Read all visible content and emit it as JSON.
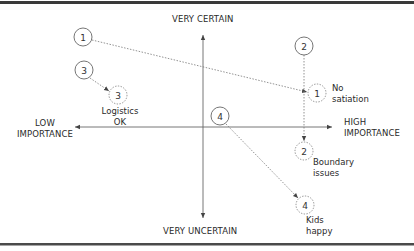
{
  "diagram": {
    "type": "quadrant-matrix",
    "axes": {
      "top_label": "VERY CERTAIN",
      "bottom_label": "VERY UNCERTAIN",
      "left_label_line1": "LOW",
      "left_label_line2": "IMPORTANCE",
      "right_label_line1": "HIGH",
      "right_label_line2": "IMPORTANCE"
    },
    "nodes": [
      {
        "id": "start-1",
        "number": "1",
        "style": "solid",
        "x": 83,
        "y": 37
      },
      {
        "id": "start-3",
        "number": "3",
        "style": "solid",
        "x": 84,
        "y": 70
      },
      {
        "id": "start-2",
        "number": "2",
        "style": "solid",
        "x": 304,
        "y": 46
      },
      {
        "id": "start-4",
        "number": "4",
        "style": "solid",
        "x": 220,
        "y": 116
      },
      {
        "id": "end-3",
        "number": "3",
        "style": "dashed",
        "x": 118,
        "y": 95,
        "caption_line1": "Logistics",
        "caption_line2": "OK"
      },
      {
        "id": "end-1",
        "number": "1",
        "style": "dashed",
        "x": 317,
        "y": 93,
        "caption_line1": "No",
        "caption_line2": "satiation"
      },
      {
        "id": "end-2",
        "number": "2",
        "style": "dashed",
        "x": 304,
        "y": 151,
        "caption_line1": "Boundary",
        "caption_line2": "issues"
      },
      {
        "id": "end-4",
        "number": "4",
        "style": "dashed",
        "x": 305,
        "y": 205,
        "caption_line1": "Kids",
        "caption_line2": "happy"
      }
    ],
    "arrows": [
      {
        "from": "start-1",
        "to": "end-1"
      },
      {
        "from": "start-3",
        "to": "end-3"
      },
      {
        "from": "start-2",
        "to": "end-2"
      },
      {
        "from": "start-4",
        "to": "end-4"
      }
    ],
    "colors": {
      "border": "#3a3a3a",
      "axis": "#555555",
      "circle": "#666666",
      "text": "#2a2a2a"
    }
  }
}
